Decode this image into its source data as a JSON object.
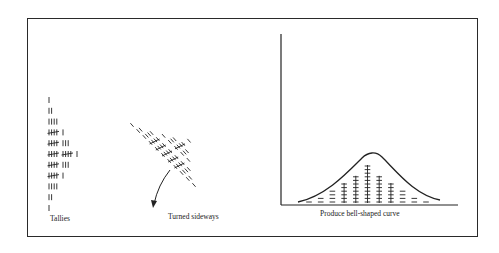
{
  "figure": {
    "panels": [
      {
        "id": "tallies",
        "caption": "Tallies"
      },
      {
        "id": "sideways",
        "caption": "Turned sideways"
      },
      {
        "id": "bell",
        "caption": "Produce bell-shaped curve"
      }
    ]
  },
  "tallies": {
    "counts": [
      1,
      2,
      4,
      6,
      8,
      11,
      8,
      6,
      4,
      2,
      1
    ]
  },
  "colors": {
    "ink": "#222222",
    "background": "#ffffff"
  }
}
